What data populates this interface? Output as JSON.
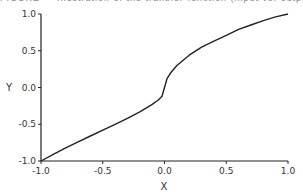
{
  "chart_data": {
    "type": "line",
    "title": "",
    "xlabel": "X",
    "ylabel": "Y",
    "xlim": [
      -1.0,
      1.0
    ],
    "ylim": [
      -1.0,
      1.0
    ],
    "grid": false,
    "legend": null,
    "x_ticks": [
      "-1.0",
      "-0.5",
      "0.0",
      "0.5",
      "1.0"
    ],
    "y_ticks": [
      "-1.0",
      "-0.5",
      "0.0",
      "0.5",
      "1.0"
    ],
    "series": [
      {
        "name": "curve",
        "x": [
          -1.0,
          -0.9,
          -0.8,
          -0.7,
          -0.6,
          -0.5,
          -0.4,
          -0.3,
          -0.2,
          -0.1,
          -0.05,
          -0.02,
          0.0,
          0.02,
          0.05,
          0.1,
          0.2,
          0.3,
          0.4,
          0.5,
          0.6,
          0.7,
          0.8,
          0.9,
          1.0
        ],
        "y": [
          -1.0,
          -0.91,
          -0.82,
          -0.74,
          -0.66,
          -0.58,
          -0.5,
          -0.42,
          -0.33,
          -0.23,
          -0.17,
          -0.12,
          0.0,
          0.12,
          0.2,
          0.3,
          0.44,
          0.55,
          0.63,
          0.71,
          0.79,
          0.85,
          0.91,
          0.96,
          1.0
        ]
      }
    ]
  },
  "caption": "FIGURE — Illustration of the transfer function (input vs. output)"
}
